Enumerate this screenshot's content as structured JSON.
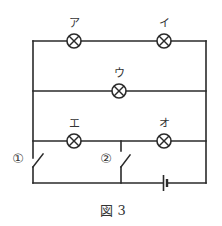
{
  "figure": {
    "caption": "図 3",
    "colors": {
      "line": "#2a2a2a",
      "background": "#ffffff"
    }
  },
  "lamps": [
    {
      "id": "a",
      "label": "ア",
      "cx": 74,
      "cy": 41
    },
    {
      "id": "i",
      "label": "イ",
      "cx": 164,
      "cy": 41
    },
    {
      "id": "u",
      "label": "ウ",
      "cx": 119,
      "cy": 91
    },
    {
      "id": "e",
      "label": "エ",
      "cx": 74,
      "cy": 141
    },
    {
      "id": "o",
      "label": "オ",
      "cx": 164,
      "cy": 141
    }
  ],
  "switches": [
    {
      "id": "1",
      "label": "①"
    },
    {
      "id": "2",
      "label": "②"
    }
  ],
  "battery": {
    "name": "battery"
  }
}
